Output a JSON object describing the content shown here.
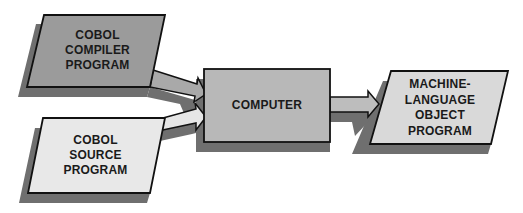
{
  "diagram": {
    "colors": {
      "compiler_fill": "#9b9b9b",
      "source_fill": "#e8e8e8",
      "computer_fill": "#b8b8b8",
      "output_fill": "#d9d9d9",
      "shadow": "#6f6f6f",
      "stroke": "#111111",
      "text": "#1a1a1a"
    },
    "nodes": [
      {
        "id": "compiler",
        "lines": [
          "COBOL",
          "COMPILER",
          "PROGRAM"
        ]
      },
      {
        "id": "source",
        "lines": [
          "COBOL",
          "SOURCE",
          "PROGRAM"
        ]
      },
      {
        "id": "computer",
        "lines": [
          "COMPUTER"
        ]
      },
      {
        "id": "output",
        "lines": [
          "MACHINE-",
          "LANGUAGE",
          "OBJECT",
          "PROGRAM"
        ]
      }
    ],
    "edges": [
      {
        "from": "compiler",
        "to": "computer"
      },
      {
        "from": "source",
        "to": "computer"
      },
      {
        "from": "computer",
        "to": "output"
      }
    ]
  }
}
